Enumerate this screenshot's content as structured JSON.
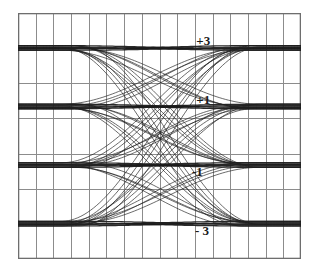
{
  "chart_data": {
    "type": "line",
    "title": "",
    "subtitle": "",
    "xlabel": "",
    "ylabel": "",
    "plot_kind": "eye-diagram",
    "modulation": "4-PAM",
    "xlim": [
      0,
      2
    ],
    "ylim": [
      -4.2,
      4.2
    ],
    "grid": true,
    "grid_columns": 16,
    "grid_rows": 7,
    "grid_color": "#8c8c8c",
    "trace_color": "#1a1a1a",
    "background_color": "#ffffff",
    "legend_position": "none",
    "annotations": [
      {
        "id": "level-plus-3",
        "label": "+3",
        "value": 3,
        "x_frac": 0.63,
        "y_frac": 0.115
      },
      {
        "id": "level-plus-1",
        "label": "+1",
        "value": 1,
        "x_frac": 0.63,
        "y_frac": 0.355
      },
      {
        "id": "level-minus-1",
        "label": "-1",
        "value": -1,
        "x_frac": 0.615,
        "y_frac": 0.645
      },
      {
        "id": "level-minus-3",
        "label": "- 3",
        "value": -3,
        "x_frac": 0.625,
        "y_frac": 0.885
      }
    ],
    "levels": [
      3,
      1,
      -1,
      -3
    ],
    "level_labels": [
      "+3",
      "+1",
      "-1",
      "- 3"
    ],
    "eye_crossings_y": [
      0
    ],
    "series": [
      {
        "name": "eye-trace-outer-upper",
        "from": -3,
        "to": 3
      },
      {
        "name": "eye-trace-outer-lower",
        "from": 3,
        "to": -3
      },
      {
        "name": "eye-trace-inner-upper",
        "from": -1,
        "to": 1
      },
      {
        "name": "eye-trace-inner-lower",
        "from": 1,
        "to": -1
      },
      {
        "name": "eye-trace-hold-plus-3",
        "from": 3,
        "to": 3
      },
      {
        "name": "eye-trace-hold-plus-1",
        "from": 1,
        "to": 1
      },
      {
        "name": "eye-trace-hold-minus-1",
        "from": -1,
        "to": -1
      },
      {
        "name": "eye-trace-hold-minus-3",
        "from": -3,
        "to": -3
      }
    ],
    "transition_pairs": [
      [
        3,
        3
      ],
      [
        3,
        1
      ],
      [
        3,
        -1
      ],
      [
        3,
        -3
      ],
      [
        1,
        3
      ],
      [
        1,
        1
      ],
      [
        1,
        -1
      ],
      [
        1,
        -3
      ],
      [
        -1,
        3
      ],
      [
        -1,
        1
      ],
      [
        -1,
        -1
      ],
      [
        -1,
        -3
      ],
      [
        -3,
        3
      ],
      [
        -3,
        1
      ],
      [
        -3,
        -1
      ],
      [
        -3,
        -3
      ]
    ]
  }
}
